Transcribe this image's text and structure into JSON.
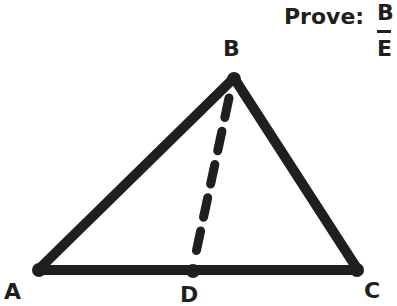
{
  "prove": {
    "label": "Prove:",
    "fraction": {
      "numerator": "B",
      "denominator": "E"
    }
  },
  "vertices": {
    "A": {
      "label": "A",
      "x": 38,
      "y": 270
    },
    "B": {
      "label": "B",
      "x": 234,
      "y": 78
    },
    "C": {
      "label": "C",
      "x": 358,
      "y": 270
    },
    "D": {
      "label": "D",
      "x": 193,
      "y": 271
    }
  },
  "segments": [
    {
      "from": "A",
      "to": "B",
      "style": "solid"
    },
    {
      "from": "B",
      "to": "C",
      "style": "solid"
    },
    {
      "from": "A",
      "to": "C",
      "style": "solid"
    },
    {
      "from": "B",
      "to": "D",
      "style": "dashed"
    }
  ],
  "colors": {
    "stroke": "#1f1f1f",
    "background": "#ffffff"
  }
}
